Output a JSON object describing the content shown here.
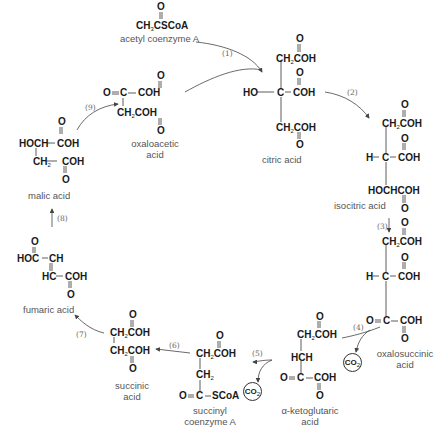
{
  "compounds": {
    "acetyl_coa": {
      "name": "acetyl coenzyme A",
      "formula": "CH3CSCoA",
      "lines": [
        "O",
        "CH",
        "3",
        "CSCoA"
      ]
    },
    "citric": {
      "name": "citric acid",
      "lines": [
        "O",
        "CH",
        "2",
        "COH",
        "O",
        "HO",
        "C",
        "COH",
        "CH",
        "2",
        "COH",
        "O"
      ]
    },
    "isocitric": {
      "name": "isocitric acid",
      "lines": [
        "O",
        "CH",
        "2",
        "COH",
        "O",
        "H",
        "C",
        "COH",
        "HOCHCOH",
        "O"
      ]
    },
    "oxalosuccinic": {
      "name_line1": "oxalosuccinic",
      "name_line2": "acid",
      "lines": [
        "O",
        "CH",
        "2",
        "COH",
        "O",
        "H",
        "C",
        "COH",
        "O",
        "C",
        "COH",
        "O"
      ]
    },
    "ketoglutaric": {
      "name_line1": "α-ketoglutaric",
      "name_line2": "acid",
      "lines": [
        "O",
        "CH",
        "2",
        "COH",
        "HCH",
        "O",
        "C",
        "COH",
        "O"
      ]
    },
    "succinyl_coa": {
      "name_line1": "succinyl",
      "name_line2": "coenzyme A",
      "lines": [
        "O",
        "CH",
        "2",
        "COH",
        "CH",
        "2",
        "O",
        "C",
        "SCoA"
      ]
    },
    "succinic": {
      "name_line1": "succinic",
      "name_line2": "acid",
      "lines": [
        "O",
        "CH",
        "2",
        "COH",
        "CH",
        "2",
        "COH",
        "O"
      ]
    },
    "fumaric": {
      "name": "fumaric acid",
      "lines": [
        "O",
        "HOC",
        "CH",
        "HC",
        "COH",
        "O"
      ]
    },
    "malic": {
      "name": "malic acid",
      "lines": [
        "O",
        "HOCH",
        "COH",
        "CH",
        "2",
        "COH",
        "O"
      ]
    },
    "oxaloacetic": {
      "name_line1": "oxaloacetic",
      "name_line2": "acid",
      "lines": [
        "O",
        "O",
        "C",
        "COH",
        "CH",
        "2",
        "COH",
        "O"
      ]
    }
  },
  "steps": [
    "(1)",
    "(2)",
    "(3)",
    "(4)",
    "(5)",
    "(6)",
    "(7)",
    "(8)",
    "(9)"
  ],
  "byproducts": {
    "co2_a": "CO",
    "co2_b": "CO",
    "co2_sub": "2"
  },
  "colors": {
    "text": "#1a1a1a",
    "label": "#555555",
    "arrow": "#444444"
  }
}
